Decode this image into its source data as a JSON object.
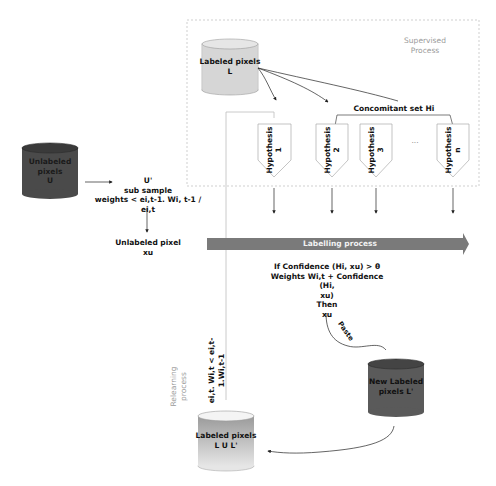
{
  "caption": "… ing and the pixel using … ent sampling process … ly …",
  "supervised_region": {
    "label_line1": "Supervised",
    "label_line2": "Process"
  },
  "cylinders": {
    "unlabeled_u": {
      "line1": "Unlabeled",
      "line2": "pixels",
      "line3": "U",
      "fill": "#4a4a4a"
    },
    "labeled_l": {
      "line1": "Labeled pixels",
      "line2": "L",
      "fill": "#d4d4d4"
    },
    "new_labeled": {
      "line1": "New Labeled",
      "line2": "pixels L'",
      "fill": "#5a5a5a"
    },
    "labeled_union": {
      "line1": "Labeled pixels",
      "line2": "L U L'",
      "fill": "#c8c8c8"
    }
  },
  "subsample": {
    "line1": "U'",
    "line2": "sub sample",
    "line3": "weights < ei,t-1. Wi, t-1 / ei,t"
  },
  "unlabeled_pixel": {
    "line1": "Unlabeled pixel",
    "line2": "xu"
  },
  "concomitant": {
    "label": "Concomitant set Hi"
  },
  "hypotheses": [
    {
      "label": "Hypothesis",
      "index": "1"
    },
    {
      "label": "Hypothesis",
      "index": "2"
    },
    {
      "label": "Hypothesis",
      "index": "3"
    },
    {
      "label": "Hypothesis",
      "index": "n"
    }
  ],
  "ellipsis": "...",
  "labelling_process": {
    "label": "Labelling process",
    "color": "#7a7a7a"
  },
  "condition": {
    "line1": "If Confidence (Hi, xu) > θ",
    "line2": "Weights Wi,t + Confidence (Hi,",
    "line3": "xu)",
    "line4": "Then",
    "line5": "xu"
  },
  "paste": {
    "label": "Paste"
  },
  "relearning": {
    "line1": "Relearning",
    "line2": "process"
  },
  "relearn_weights": {
    "line1": "ei,t. Wi,t < ei,t-",
    "line2": "1.Wi,t-1"
  }
}
